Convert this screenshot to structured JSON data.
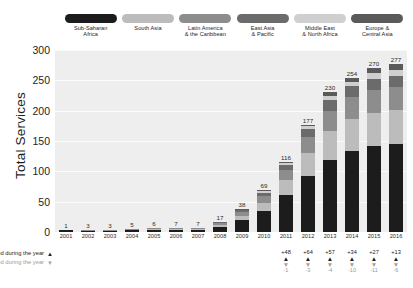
{
  "chart_data": {
    "type": "bar",
    "title": "",
    "xlabel": "",
    "ylabel": "Total Services",
    "ylim": [
      0,
      300
    ],
    "yticks": [
      0,
      50,
      100,
      150,
      200,
      250,
      300
    ],
    "grid": true,
    "stacked": true,
    "legend_position": "top",
    "categories": [
      "2001",
      "2002",
      "2003",
      "2004",
      "2005",
      "2006",
      "2007",
      "2008",
      "2009",
      "2010",
      "2011",
      "2012",
      "2013",
      "2014",
      "2015",
      "2016"
    ],
    "totals": [
      1,
      3,
      3,
      5,
      6,
      7,
      7,
      17,
      38,
      69,
      116,
      177,
      230,
      254,
      270,
      277
    ],
    "series": [
      {
        "name": "Sub-Saharan Africa",
        "color": "#1c1c1c",
        "values": [
          1,
          2,
          2,
          3,
          4,
          4,
          4,
          9,
          19,
          35,
          61,
          93,
          118,
          134,
          142,
          145
        ]
      },
      {
        "name": "South Asia",
        "color": "#bcbcbc",
        "values": [
          0,
          0,
          0,
          1,
          1,
          1,
          1,
          3,
          8,
          13,
          24,
          37,
          48,
          52,
          55,
          56
        ]
      },
      {
        "name": "Latin America & the Caribbean",
        "color": "#8d8d8d",
        "values": [
          0,
          1,
          1,
          1,
          1,
          1,
          1,
          3,
          6,
          11,
          17,
          27,
          34,
          36,
          37,
          38
        ]
      },
      {
        "name": "East Asia & Pacific",
        "color": "#6b6b6b",
        "values": [
          0,
          0,
          0,
          0,
          0,
          1,
          1,
          1,
          3,
          6,
          9,
          12,
          17,
          18,
          19,
          19
        ]
      },
      {
        "name": "Middle East & North Africa",
        "color": "#cfcfcf",
        "values": [
          0,
          0,
          0,
          0,
          0,
          0,
          0,
          1,
          1,
          2,
          3,
          5,
          7,
          8,
          9,
          9
        ]
      },
      {
        "name": "Europe & Central Asia",
        "color": "#5a5a5a",
        "values": [
          0,
          0,
          0,
          0,
          0,
          0,
          0,
          0,
          1,
          2,
          2,
          3,
          6,
          6,
          8,
          10
        ]
      }
    ],
    "annotations": {
      "launched_label": "Services launched during the year",
      "closed_label": "Services closed or merged during the year",
      "launched_marker": "▲",
      "closed_marker": "▼",
      "columns": [
        {
          "year": "2011",
          "launched": "+48",
          "closed": "-1"
        },
        {
          "year": "2012",
          "launched": "+64",
          "closed": "-3"
        },
        {
          "year": "2013",
          "launched": "+57",
          "closed": "-4"
        },
        {
          "year": "2014",
          "launched": "+34",
          "closed": "-10"
        },
        {
          "year": "2015",
          "launched": "+27",
          "closed": "-11"
        },
        {
          "year": "2016",
          "launched": "+13",
          "closed": "-6"
        }
      ]
    }
  },
  "legend": {
    "items": [
      {
        "label": "Sub-Saharan\nAfrica",
        "color": "#1c1c1c"
      },
      {
        "label": "South Asia",
        "color": "#bcbcbc"
      },
      {
        "label": "Latin America\n& the Caribbean",
        "color": "#8d8d8d"
      },
      {
        "label": "East Asia\n& Pacific",
        "color": "#6b6b6b"
      },
      {
        "label": "Middle East\n& North Africa",
        "color": "#cfcfcf"
      },
      {
        "label": "Europe &\nCentral Asia",
        "color": "#5a5a5a"
      }
    ]
  },
  "colors": {
    "plot_background": "#eeeeee",
    "page_background": "#ffffff",
    "gridline": "#fbfbfb",
    "text": "#1e1e1e",
    "muted_text": "#9a9a9a"
  }
}
